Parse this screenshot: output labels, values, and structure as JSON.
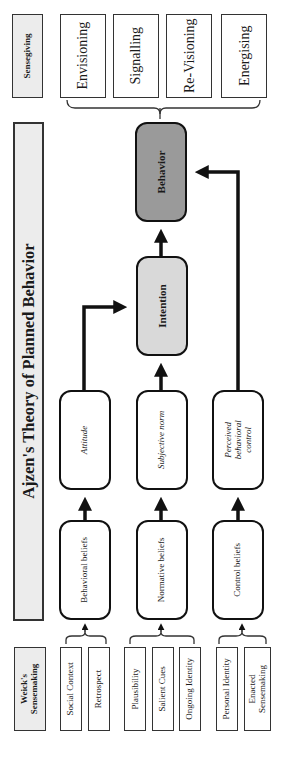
{
  "sensegiving": {
    "header": "Sensegiving",
    "items": [
      {
        "label": "Envisioning"
      },
      {
        "label": "Signalling"
      },
      {
        "label": "Re-Visioning"
      },
      {
        "label": "Energising"
      }
    ]
  },
  "ajzen": {
    "title": "Ajzen's Theory of Planned Behavior",
    "behavior": "Behavior",
    "intention": "Intention",
    "determinants": [
      {
        "label": "Attitude"
      },
      {
        "label": "Subjective norm"
      },
      {
        "label_lines": [
          "Perceived",
          "behavioral",
          "control"
        ]
      }
    ],
    "beliefs": [
      {
        "label": "Behavioral beliefs"
      },
      {
        "label": "Normative beliefs"
      },
      {
        "label": "Control beliefs"
      }
    ]
  },
  "weick": {
    "header_lines": [
      "Weick's",
      "Sensemaking"
    ],
    "groups": [
      {
        "items": [
          {
            "label": "Social Context"
          },
          {
            "label": "Retrospect"
          }
        ]
      },
      {
        "items": [
          {
            "label": "Plausibility"
          },
          {
            "label": "Salient Cues"
          },
          {
            "label": "Ongoing Identity"
          }
        ]
      },
      {
        "items": [
          {
            "label": "Personal Identity"
          },
          {
            "label_lines": [
              "Enacted",
              "Sensemaking"
            ]
          }
        ]
      }
    ]
  },
  "colors": {
    "header_fill": "#ececec",
    "intention_fill": "#d9d9d9",
    "behavior_fill": "#9a9a9a",
    "stroke": "#111111"
  }
}
